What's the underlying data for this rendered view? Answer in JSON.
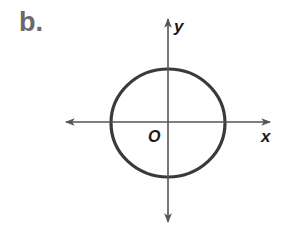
{
  "figure": {
    "panel_label": "b.",
    "x_axis_label": "x",
    "y_axis_label": "y",
    "origin_label": "O",
    "shape": "circle",
    "colors": {
      "axis": "#555555",
      "circle": "#3a3a3a",
      "panel_label": "#6a6a6a",
      "text": "#1a1a1a"
    }
  }
}
